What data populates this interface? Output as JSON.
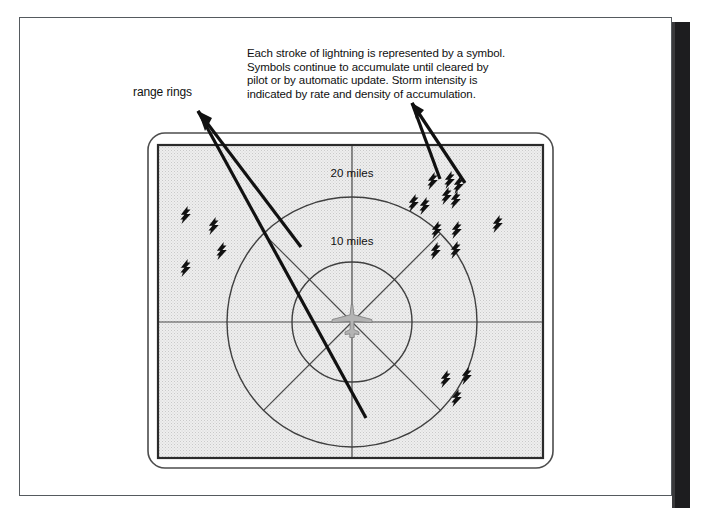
{
  "figure": {
    "kind": "stormscope-lightning-display-diagram",
    "annotations": {
      "range_rings_label": "range rings",
      "strokes_note": "Each stroke of lightning is represented by a symbol.\nSymbols continue to accumulate until cleared by\npilot or by automatic update.  Storm intensity is\nindicated by rate and density of accumulation."
    },
    "display": {
      "ring_labels": {
        "outer": "20 miles",
        "inner": "10 miles"
      },
      "center_symbol": "aircraft-icon",
      "stroke_symbol": "lightning-bolt-icon"
    },
    "colors": {
      "page_border": "#555a5e",
      "spine_band": "#1d1d1f",
      "screen_fill": "#e9e9e9",
      "screen_border": "#333333",
      "bezel_border": "#4a4a4a",
      "ring_stroke": "#444444",
      "leader_line": "#111111",
      "bolt_fill": "#111111",
      "aircraft_fill": "#b4b4b4",
      "text": "#101010"
    },
    "geometry": {
      "page_frame": {
        "x": 19,
        "y": 17,
        "w": 653,
        "h": 479
      },
      "bezel": {
        "x": 148,
        "y": 133,
        "w": 405,
        "h": 335,
        "radius": 16
      },
      "screen": {
        "x": 158,
        "y": 145,
        "w": 385,
        "h": 313
      },
      "center": {
        "x": 352,
        "y": 322
      },
      "ring_radius_inner": 60,
      "ring_radius_outer": 125
    },
    "lightning_strokes": [
      {
        "id": "sw-far-1",
        "x": 186,
        "y": 215,
        "s": 1.0
      },
      {
        "id": "sw-far-2",
        "x": 214,
        "y": 226,
        "s": 1.0
      },
      {
        "id": "sw-far-3",
        "x": 222,
        "y": 251,
        "s": 1.0
      },
      {
        "id": "sw-far-4",
        "x": 186,
        "y": 268,
        "s": 1.0
      },
      {
        "id": "ne-1",
        "x": 433,
        "y": 181,
        "s": 1.0
      },
      {
        "id": "ne-2",
        "x": 450,
        "y": 180,
        "s": 1.0
      },
      {
        "id": "ne-3",
        "x": 459,
        "y": 185,
        "s": 1.0
      },
      {
        "id": "ne-4",
        "x": 414,
        "y": 203,
        "s": 1.0
      },
      {
        "id": "ne-5",
        "x": 425,
        "y": 206,
        "s": 1.0
      },
      {
        "id": "ne-6",
        "x": 447,
        "y": 196,
        "s": 1.0
      },
      {
        "id": "ne-7",
        "x": 456,
        "y": 200,
        "s": 1.0
      },
      {
        "id": "ne-8",
        "x": 437,
        "y": 230,
        "s": 1.0
      },
      {
        "id": "ne-9",
        "x": 457,
        "y": 230,
        "s": 1.0
      },
      {
        "id": "ne-10",
        "x": 436,
        "y": 251,
        "s": 1.0
      },
      {
        "id": "ne-11",
        "x": 456,
        "y": 250,
        "s": 1.0
      },
      {
        "id": "e-outside",
        "x": 498,
        "y": 224,
        "s": 1.0
      },
      {
        "id": "se-1",
        "x": 446,
        "y": 379,
        "s": 1.0
      },
      {
        "id": "se-2",
        "x": 467,
        "y": 376,
        "s": 1.0
      },
      {
        "id": "se-3",
        "x": 457,
        "y": 398,
        "s": 1.0
      }
    ],
    "leader_lines": {
      "range_rings": [
        {
          "x1": 198,
          "y1": 112,
          "x2": 300,
          "y2": 246
        },
        {
          "x1": 198,
          "y1": 112,
          "x2": 364,
          "y2": 416
        }
      ],
      "strokes_note": [
        {
          "x1": 412,
          "y1": 104,
          "x2": 440,
          "y2": 178
        },
        {
          "x1": 412,
          "y1": 104,
          "x2": 464,
          "y2": 182
        }
      ]
    }
  }
}
